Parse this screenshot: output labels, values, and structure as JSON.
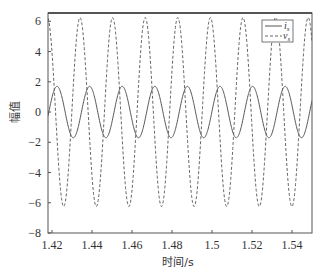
{
  "chart_data": {
    "type": "line",
    "title": "",
    "xlabel": "时间/s",
    "ylabel": "幅值",
    "xlim": [
      1.418,
      1.55
    ],
    "ylim": [
      -8,
      6.55
    ],
    "grid": false,
    "legend_position": "upper right",
    "x_ticks": [
      1.42,
      1.44,
      1.46,
      1.48,
      1.5,
      1.52,
      1.54
    ],
    "x_tick_labels": [
      "1.42",
      "1.44",
      "1.46",
      "1.48",
      "1.5",
      "1.52",
      "1.54"
    ],
    "y_ticks": [
      6,
      4,
      2,
      0,
      -2,
      -4,
      -6,
      -8
    ],
    "y_tick_labels": [
      "6",
      "4",
      "2",
      "0",
      "−2",
      "−4",
      "−6",
      "−8"
    ],
    "series": [
      {
        "name": "i_s",
        "label_main": "i",
        "label_sub": "s",
        "style": "solid",
        "color": "#555555",
        "waveform": "sine",
        "amplitude": 1.7,
        "period": 0.0163,
        "peak_time": 1.4225,
        "offset": 0.0
      },
      {
        "name": "v_s",
        "label_main": "v",
        "label_sub": "s",
        "style": "dashed",
        "color": "#666666",
        "waveform": "sine",
        "amplitude": 6.25,
        "period": 0.0163,
        "peak_time": 1.434,
        "offset": 0.0
      }
    ]
  }
}
